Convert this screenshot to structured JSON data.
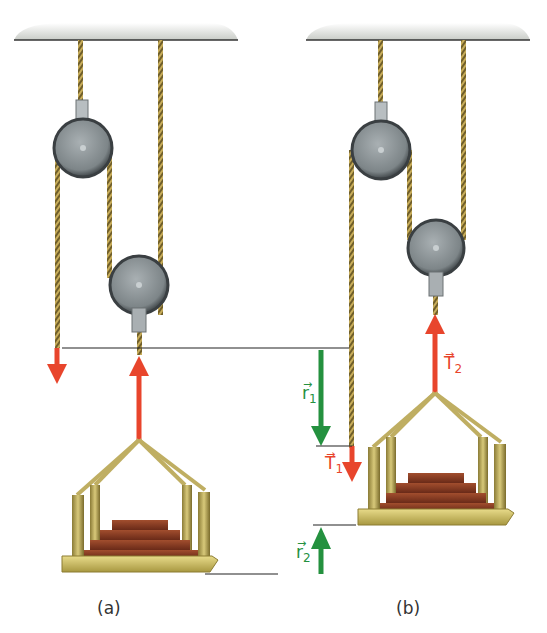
{
  "figure": {
    "panels": [
      {
        "id": "a",
        "caption": "(a)"
      },
      {
        "id": "b",
        "caption": "(b)"
      }
    ],
    "labels": {
      "T1": {
        "symbol": "T",
        "subscript": "1",
        "color": "#e8452c"
      },
      "T2": {
        "symbol": "T",
        "subscript": "2",
        "color": "#e8452c"
      },
      "r1": {
        "symbol": "r",
        "subscript": "1",
        "color": "#24913f"
      },
      "r2": {
        "symbol": "r",
        "subscript": "2",
        "color": "#24913f"
      }
    },
    "colors": {
      "force_arrow": "#e8452c",
      "displacement_arrow": "#24913f",
      "rope": "#b89a4a",
      "pulley": "#7c8488",
      "ceiling": "#d8dbd6",
      "bricks": "#8a3b24",
      "platform": "#c9b762"
    }
  }
}
